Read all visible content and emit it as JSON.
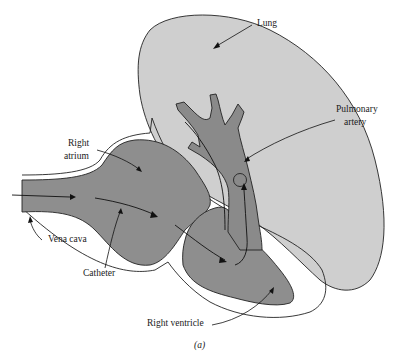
{
  "diagram": {
    "caption": "(a)",
    "labels": {
      "lung": "Lung",
      "pulmonary_artery_1": "Pulmonary",
      "pulmonary_artery_2": "artery",
      "right_atrium_1": "Right",
      "right_atrium_2": "atrium",
      "vena_cava": "Vena cava",
      "catheter": "Catheter",
      "right_ventricle": "Right ventricle"
    },
    "colors": {
      "lung_fill": "#cfcfcf",
      "chamber_fill": "#8e8e8e",
      "artery_fill": "#8a8a8a",
      "outline": "#222222",
      "background": "#ffffff"
    }
  }
}
